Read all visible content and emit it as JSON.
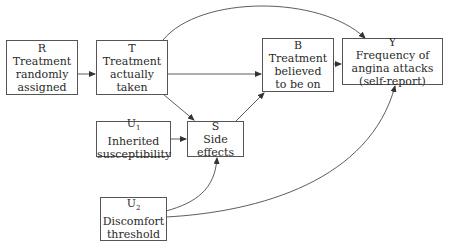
{
  "diagram": {
    "type": "causal-dag",
    "nodes": [
      {
        "id": "R",
        "symbol": "R",
        "sub": "",
        "lines": [
          "Treatment",
          "randomly",
          "assigned"
        ]
      },
      {
        "id": "T",
        "symbol": "T",
        "sub": "",
        "lines": [
          "Treatment",
          "actually",
          "taken"
        ]
      },
      {
        "id": "B",
        "symbol": "B",
        "sub": "",
        "lines": [
          "Treatment",
          "believed",
          "to be on"
        ]
      },
      {
        "id": "Y",
        "symbol": "Y",
        "sub": "",
        "lines": [
          "Frequency of",
          "angina attacks",
          "(self-report)"
        ]
      },
      {
        "id": "U1",
        "symbol": "U",
        "sub": "1",
        "lines": [
          "Inherited",
          "susceptibility"
        ]
      },
      {
        "id": "S",
        "symbol": "S",
        "sub": "",
        "lines": [
          "Side",
          "effects"
        ]
      },
      {
        "id": "U2",
        "symbol": "U",
        "sub": "2",
        "lines": [
          "Discomfort",
          "threshold"
        ]
      }
    ],
    "edges": [
      {
        "from": "R",
        "to": "T",
        "style": "straight"
      },
      {
        "from": "T",
        "to": "B",
        "style": "straight"
      },
      {
        "from": "B",
        "to": "Y",
        "style": "straight"
      },
      {
        "from": "T",
        "to": "Y",
        "style": "curved"
      },
      {
        "from": "T",
        "to": "S",
        "style": "straight"
      },
      {
        "from": "U1",
        "to": "S",
        "style": "straight"
      },
      {
        "from": "S",
        "to": "B",
        "style": "straight"
      },
      {
        "from": "U2",
        "to": "S",
        "style": "curved"
      },
      {
        "from": "U2",
        "to": "Y",
        "style": "curved"
      }
    ],
    "colors": {
      "line": "#333333",
      "border": "#555555",
      "text": "#2a2a2a"
    }
  }
}
